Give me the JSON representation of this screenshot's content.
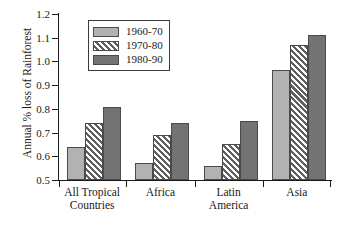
{
  "chart_data": {
    "type": "bar",
    "title": "",
    "xlabel": "",
    "ylabel": "Annual % loss of Rainforest",
    "ylim": [
      0.5,
      1.2
    ],
    "ytick_labels": [
      "1.2",
      "1.1",
      "1.0",
      "0.9",
      "0.8",
      "0.7",
      "0.6",
      "0.5"
    ],
    "ytick_values": [
      1.2,
      1.1,
      1.0,
      0.9,
      0.8,
      0.7,
      0.6,
      0.5
    ],
    "grid": false,
    "legend_position": "upper-left-inside",
    "categories": [
      "All Tropical Countries",
      "Africa",
      "Latin America",
      "Asia"
    ],
    "category_lines": [
      [
        "All Tropical",
        "Countries"
      ],
      [
        "Africa"
      ],
      [
        "Latin",
        "America"
      ],
      [
        "Asia"
      ]
    ],
    "series": [
      {
        "name": "1960-70",
        "color": "#b2b2b2",
        "fill": "solid-light-gray",
        "values": [
          0.64,
          0.57,
          0.56,
          0.965
        ]
      },
      {
        "name": "1970-80",
        "color": "#ffffff",
        "fill": "diagonal-hatch",
        "values": [
          0.74,
          0.69,
          0.65,
          1.07
        ]
      },
      {
        "name": "1980-90",
        "color": "#737373",
        "fill": "solid-dark-gray",
        "values": [
          0.81,
          0.74,
          0.75,
          1.11
        ]
      }
    ]
  }
}
